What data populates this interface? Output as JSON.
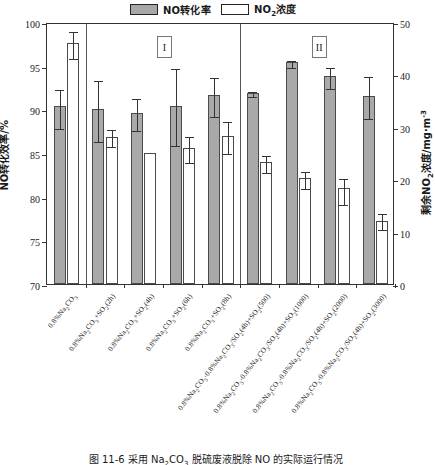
{
  "chart_data": {
    "type": "bar",
    "title": "",
    "caption": "图 11-6   采用 Na2CO3 脱硫废液脱除 NO 的实际运行情况",
    "categories": [
      "0.8%Na2CO3",
      "0.8%Na2CO3+SO2(2h)",
      "0.8%Na2CO3+SO2(4h)",
      "0.8%Na2CO3+SO2(6h)",
      "0.8%Na2CO3+SO2(8h)",
      "0.8%Na2CO3-0.8%Na2CO3/SO2(4h)+SO2(500)",
      "0.8%Na2CO3-0.8%Na2CO3/SO2(4h)+SO2(1000)",
      "0.8%Na2CO3-0.8%Na2CO3/SO2(4h)+SO2(2000)",
      "0.8%Na2CO3-0.8%Na2CO3/SO2(4h)+SO2(3000)"
    ],
    "ylabel": "NO转化效率/%",
    "ylabel_right": "剩余NO2浓度/mg·m-3",
    "xlabel": "",
    "ylim": [
      70,
      100
    ],
    "ylim_right": [
      0,
      50
    ],
    "yticks": [
      70,
      75,
      80,
      85,
      90,
      95,
      100
    ],
    "yticks_right": [
      0,
      10,
      20,
      30,
      40,
      50
    ],
    "grid": false,
    "legend_position": "top",
    "series": [
      {
        "name": "NO转化率",
        "axis": "left",
        "color": "#a9a9a9",
        "values": [
          90.4,
          90.0,
          89.6,
          90.4,
          91.6,
          91.9,
          95.4,
          93.8,
          91.5
        ],
        "err_low": [
          2.4,
          3.5,
          1.8,
          4.4,
          2.2,
          0.3,
          0.4,
          1.2,
          2.4
        ],
        "err_high": [
          2.1,
          3.5,
          1.8,
          4.4,
          2.2,
          0.3,
          0.4,
          1.2,
          2.4
        ]
      },
      {
        "name": "NO2浓度",
        "axis": "right",
        "color": "#ffffff",
        "values": [
          45.9,
          28.1,
          25.0,
          26.0,
          28.3,
          23.2,
          20.2,
          18.4,
          12.1
        ],
        "err_low": [
          2.5,
          1.5,
          0.0,
          2.5,
          3.1,
          1.6,
          1.6,
          3.0,
          1.4
        ],
        "err_high": [
          2.5,
          1.6,
          0.0,
          2.5,
          3.0,
          1.6,
          1.6,
          2.1,
          1.6
        ]
      }
    ],
    "region_labels": [
      "I",
      "II"
    ],
    "separators_after_category": [
      1,
      5
    ]
  }
}
